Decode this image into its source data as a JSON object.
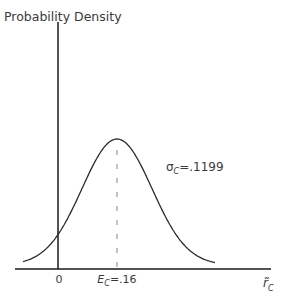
{
  "chart_data": {
    "type": "line",
    "title": "",
    "ylabel": "Probability Density",
    "xlabel": "r̃",
    "xlabel_subscript": "C",
    "distribution": "normal",
    "mean": 0.16,
    "std": 0.1199,
    "x_ticks": [
      {
        "value": 0,
        "label": "0"
      },
      {
        "value": 0.16,
        "label_main": "E",
        "label_sub": "C",
        "label_rest": "=.16"
      }
    ],
    "annotations": [
      {
        "text_main": "σ",
        "text_sub": "C",
        "text_rest": "=.1199",
        "target": "curve-right-flank"
      }
    ],
    "mean_marker": {
      "style": "dashed",
      "x": 0.16
    },
    "grid": false,
    "legend": "none"
  },
  "colors": {
    "axis": "#1a1a1a",
    "curve": "#2b2b2b",
    "dashed": "#9a9a9a",
    "text": "#3a3a3a"
  }
}
